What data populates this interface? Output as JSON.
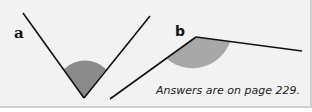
{
  "figures": [
    {
      "label": "a",
      "angle_fill": "#888888",
      "line_color": "#111111"
    },
    {
      "label": "b",
      "angle_fill": "#aaaaaa",
      "line_color": "#111111"
    }
  ],
  "footer": {
    "answer_text": "Answers are on page 229."
  }
}
